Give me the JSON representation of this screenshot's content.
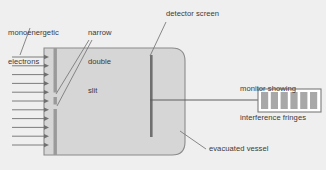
{
  "diagram": {
    "background_color": "#efefef",
    "labels": {
      "electrons": "monoenergetic\nelectrons",
      "electrons_line1": "monoenergetic",
      "electrons_line2": "electrons",
      "slit": "narrow\ndouble\nslit",
      "slit_line1": "narrow",
      "slit_line2": "double",
      "slit_line3": "slit",
      "detector": "detector screen",
      "monitor": "monitor showing\ninterference fringes",
      "monitor_line1": "monitor showing",
      "monitor_line2": "interference fringes",
      "vessel": "evacuated vessel"
    },
    "colors": {
      "vessel_fill": "#d6d6d6",
      "vessel_stroke": "#8a8a8a",
      "barrier": "#9a9a9a",
      "detector_screen": "#6f6f6f",
      "arrow": "#6f6f6f",
      "leader_line": "#7a7a7a",
      "monitor_fill": "#ffffff",
      "monitor_stroke": "#7a7a7a",
      "fringe_bar": "#a8a8a8",
      "text": "#3a3a3a"
    },
    "electron_beam": {
      "arrow_count": 11,
      "x_start": 12,
      "x_end": 49,
      "y_first": 57,
      "y_spacing": 8.8
    },
    "vessel": {
      "x": 44,
      "y": 48,
      "width": 141,
      "height": 107,
      "corner_radius": 13
    },
    "double_slit": {
      "x": 53.5,
      "y_top": 48,
      "y_bottom": 155,
      "width": 3.4,
      "slit_count": 2,
      "slits": [
        {
          "y": 92.5,
          "height": 4.5
        },
        {
          "y": 104.5,
          "height": 4.5
        }
      ]
    },
    "detector_screen": {
      "x": 150,
      "y_top": 55,
      "y_bottom": 137,
      "width": 2.6
    },
    "signal_line": {
      "x_start": 150,
      "x_end": 258,
      "y": 100
    },
    "monitor": {
      "x": 258,
      "y": 89,
      "width": 63,
      "height": 23,
      "fringe_count": 6,
      "fringe_width": 7.2,
      "fringe_gap": 2.6
    },
    "leader_lines": [
      {
        "name": "electrons-leader",
        "x1": 30,
        "y1": 28,
        "x2": 20,
        "y2": 55
      },
      {
        "name": "slit-leader-upper",
        "x1": 89,
        "y1": 40,
        "x2": 56,
        "y2": 94
      },
      {
        "name": "slit-leader-lower",
        "x1": 92,
        "y1": 40,
        "x2": 57,
        "y2": 106
      },
      {
        "name": "detector-leader",
        "x1": 166,
        "y1": 22,
        "x2": 150,
        "y2": 56
      },
      {
        "name": "vessel-leader",
        "x1": 206,
        "y1": 149,
        "x2": 180,
        "y2": 131
      }
    ]
  }
}
